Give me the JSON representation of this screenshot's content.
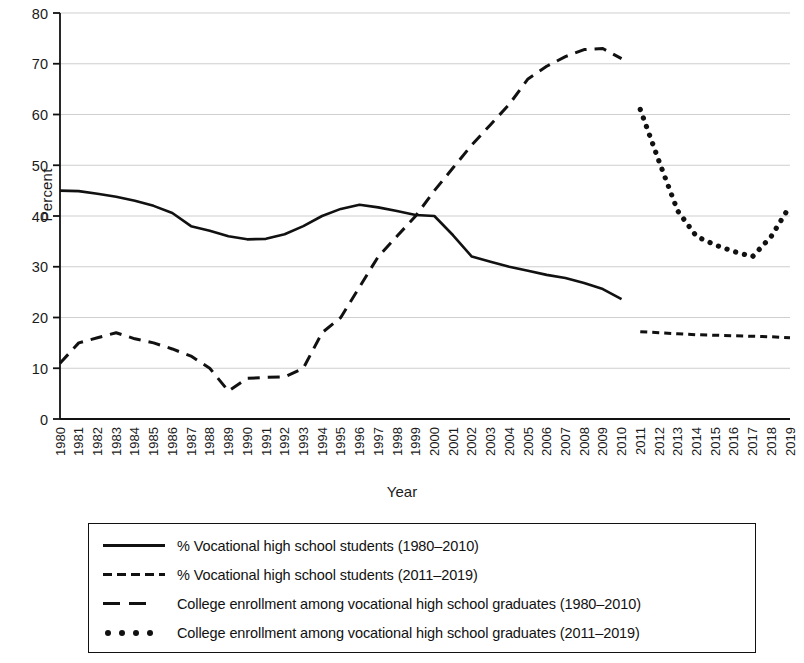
{
  "chart_data": {
    "type": "line",
    "title": "",
    "xlabel": "Year",
    "ylabel": "Percent",
    "ylim": [
      0,
      80
    ],
    "yticks": [
      0,
      10,
      20,
      30,
      40,
      50,
      60,
      70,
      80
    ],
    "grid": true,
    "legend_position": "bottom",
    "x": [
      1980,
      1981,
      1982,
      1983,
      1984,
      1985,
      1986,
      1987,
      1988,
      1989,
      1990,
      1991,
      1992,
      1993,
      1994,
      1995,
      1996,
      1997,
      1998,
      1999,
      2000,
      2001,
      2002,
      2003,
      2004,
      2005,
      2006,
      2007,
      2008,
      2009,
      2010,
      2011,
      2012,
      2013,
      2014,
      2015,
      2016,
      2017,
      2018,
      2019
    ],
    "xticks": [
      "1980",
      "1981",
      "1982",
      "1983",
      "1984",
      "1985",
      "1986",
      "1987",
      "1988",
      "1989",
      "1990",
      "1991",
      "1992",
      "1993",
      "1994",
      "1995",
      "1996",
      "1997",
      "1998",
      "1999",
      "2000",
      "2001",
      "2002",
      "2003",
      "2004",
      "2005",
      "2006",
      "2007",
      "2008",
      "2009",
      "2010",
      "2011",
      "2012",
      "2013",
      "2014",
      "2015",
      "2016",
      "2017",
      "2018",
      "2019"
    ],
    "series": [
      {
        "name": "% Vocational high school students (1980–2010)",
        "style": "solid",
        "color": "#111111",
        "x": [
          1980,
          1981,
          1982,
          1983,
          1984,
          1985,
          1986,
          1987,
          1988,
          1989,
          1990,
          1991,
          1992,
          1993,
          1994,
          1995,
          1996,
          1997,
          1998,
          1999,
          2000,
          2001,
          2002,
          2003,
          2004,
          2005,
          2006,
          2007,
          2008,
          2009,
          2010
        ],
        "values": [
          45.0,
          44.9,
          44.4,
          43.8,
          43.0,
          42.0,
          40.6,
          38.0,
          37.1,
          36.0,
          35.4,
          35.5,
          36.4,
          38.0,
          40.0,
          41.4,
          42.2,
          41.7,
          41.0,
          40.2,
          40.0,
          36.2,
          32.0,
          31.0,
          30.0,
          29.2,
          28.4,
          27.8,
          26.8,
          25.6,
          23.6
        ]
      },
      {
        "name": "% Vocational high school students (2011–2019)",
        "style": "short-dash",
        "color": "#111111",
        "x": [
          2011,
          2012,
          2013,
          2014,
          2015,
          2016,
          2017,
          2018,
          2019
        ],
        "values": [
          17.2,
          17.0,
          16.8,
          16.6,
          16.5,
          16.4,
          16.3,
          16.2,
          16.0
        ]
      },
      {
        "name": "College enrollment among vocational high school graduates (1980–2010)",
        "style": "long-dash",
        "color": "#111111",
        "x": [
          1980,
          1981,
          1982,
          1983,
          1984,
          1985,
          1986,
          1987,
          1988,
          1989,
          1990,
          1991,
          1992,
          1993,
          1994,
          1995,
          1996,
          1997,
          1998,
          1999,
          2000,
          2001,
          2002,
          2003,
          2004,
          2005,
          2006,
          2007,
          2008,
          2009,
          2010
        ],
        "values": [
          11.0,
          15.0,
          16.0,
          17.0,
          15.8,
          15.0,
          13.8,
          12.4,
          10.0,
          5.5,
          8.0,
          8.2,
          8.3,
          10.0,
          17.0,
          20.0,
          26.0,
          32.0,
          36.0,
          40.0,
          45.0,
          49.5,
          54.0,
          58.0,
          62.0,
          67.0,
          69.5,
          71.4,
          72.8,
          73.0,
          71.0
        ]
      },
      {
        "name": "College enrollment among vocational high school graduates (2011–2019)",
        "style": "dotted",
        "color": "#111111",
        "x": [
          2011,
          2012,
          2013,
          2014,
          2015,
          2016,
          2017,
          2018,
          2019
        ],
        "values": [
          61.0,
          50.8,
          41.0,
          36.0,
          34.3,
          33.0,
          32.0,
          36.0,
          42.0
        ]
      }
    ]
  },
  "axes": {
    "ylabel": "Percent",
    "xlabel": "Year"
  },
  "legend": {
    "items": [
      {
        "label": "% Vocational high school students (1980–2010)",
        "style": "solid"
      },
      {
        "label": "% Vocational high school students (2011–2019)",
        "style": "short-dash"
      },
      {
        "label": "College enrollment among vocational high school graduates (1980–2010)",
        "style": "long-dash"
      },
      {
        "label": "College enrollment among vocational high school graduates (2011–2019)",
        "style": "dotted"
      }
    ]
  },
  "colors": {
    "line": "#111111",
    "grid": "#c9c9c9",
    "axis": "#111111",
    "background": "#ffffff"
  }
}
